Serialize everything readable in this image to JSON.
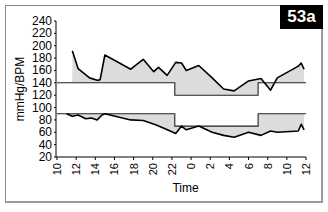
{
  "figure_label": "53a",
  "chart_data": {
    "type": "line",
    "title": "",
    "xlabel": "Time",
    "ylabel": "mmHg/BPM",
    "ylim": [
      20,
      240
    ],
    "yticks": [
      240,
      220,
      200,
      180,
      160,
      140,
      120,
      100,
      80,
      60,
      40,
      20
    ],
    "xticks": [
      "10",
      "12",
      "14",
      "16",
      "18",
      "20",
      "22",
      "0",
      "2",
      "4",
      "6",
      "8",
      "10",
      "12"
    ],
    "grid": false,
    "legend": null,
    "thresholds": {
      "systolic_day": 140,
      "systolic_night": 120,
      "diastolic_day": 90,
      "diastolic_night": 70,
      "night_start_hour": 22.3,
      "night_end_hour": 7.0
    },
    "series": [
      {
        "name": "Systolic",
        "x_hours_from_10": [
          1.6,
          2.2,
          3.4,
          4.2,
          4.5,
          5.0,
          7.7,
          9.0,
          10.1,
          10.6,
          11.5,
          12.4,
          13.0,
          13.5,
          14.8,
          16.2,
          17.4,
          18.5,
          20.0,
          21.3,
          22.3,
          23.0,
          25.2,
          25.5,
          25.8
        ],
        "values": [
          192,
          163,
          148,
          144,
          145,
          185,
          162,
          178,
          158,
          165,
          152,
          173,
          172,
          160,
          168,
          148,
          130,
          127,
          143,
          147,
          128,
          148,
          167,
          172,
          162
        ]
      },
      {
        "name": "Diastolic",
        "x_hours_from_10": [
          1.0,
          1.6,
          2.2,
          3.0,
          3.6,
          4.2,
          4.7,
          5.0,
          7.7,
          9.0,
          10.3,
          11.4,
          12.4,
          13.0,
          13.5,
          14.8,
          16.2,
          17.4,
          18.5,
          20.0,
          21.3,
          22.3,
          23.0,
          25.2,
          25.5,
          25.8
        ],
        "values": [
          90,
          86,
          88,
          82,
          83,
          80,
          88,
          90,
          80,
          79,
          72,
          65,
          58,
          70,
          64,
          70,
          60,
          55,
          52,
          60,
          55,
          62,
          60,
          62,
          73,
          64
        ]
      }
    ]
  }
}
